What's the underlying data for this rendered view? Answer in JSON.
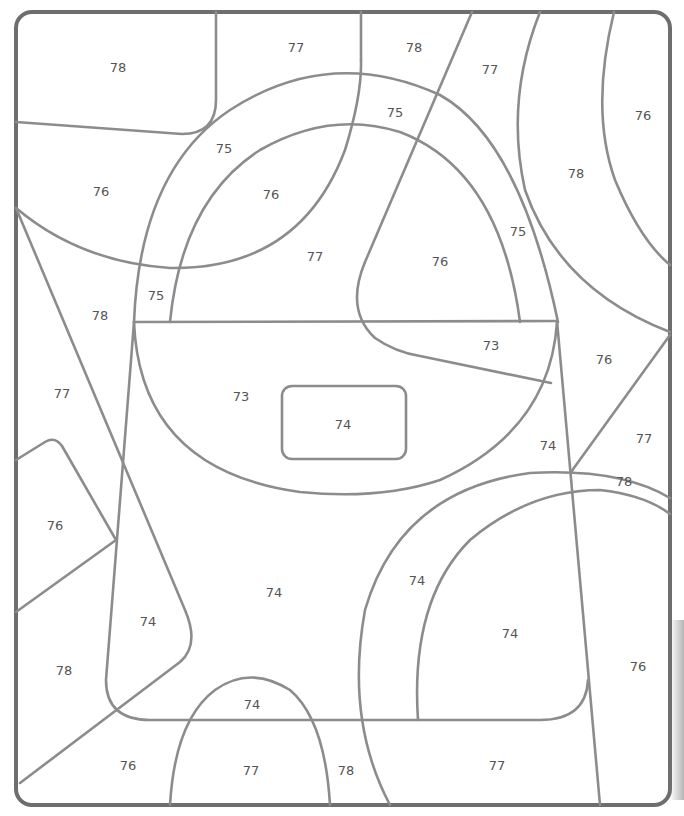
{
  "worksheet": {
    "frame_color": "#6e6e6e",
    "line_color": "#8c8c8c",
    "regions": [
      {
        "label": "78",
        "x": 118,
        "y": 67
      },
      {
        "label": "77",
        "x": 296,
        "y": 47
      },
      {
        "label": "78",
        "x": 414,
        "y": 47
      },
      {
        "label": "77",
        "x": 490,
        "y": 69
      },
      {
        "label": "76",
        "x": 643,
        "y": 115
      },
      {
        "label": "75",
        "x": 395,
        "y": 112
      },
      {
        "label": "75",
        "x": 224,
        "y": 148
      },
      {
        "label": "76",
        "x": 101,
        "y": 191
      },
      {
        "label": "76",
        "x": 271,
        "y": 194
      },
      {
        "label": "78",
        "x": 576,
        "y": 173
      },
      {
        "label": "77",
        "x": 315,
        "y": 256
      },
      {
        "label": "76",
        "x": 440,
        "y": 261
      },
      {
        "label": "75",
        "x": 518,
        "y": 231
      },
      {
        "label": "75",
        "x": 156,
        "y": 295
      },
      {
        "label": "78",
        "x": 100,
        "y": 315
      },
      {
        "label": "73",
        "x": 491,
        "y": 345
      },
      {
        "label": "76",
        "x": 604,
        "y": 359
      },
      {
        "label": "77",
        "x": 62,
        "y": 393
      },
      {
        "label": "73",
        "x": 241,
        "y": 396
      },
      {
        "label": "74",
        "x": 343,
        "y": 424
      },
      {
        "label": "74",
        "x": 548,
        "y": 445
      },
      {
        "label": "77",
        "x": 644,
        "y": 438
      },
      {
        "label": "78",
        "x": 624,
        "y": 481
      },
      {
        "label": "76",
        "x": 55,
        "y": 525
      },
      {
        "label": "74",
        "x": 274,
        "y": 592
      },
      {
        "label": "74",
        "x": 417,
        "y": 580
      },
      {
        "label": "74",
        "x": 148,
        "y": 621
      },
      {
        "label": "74",
        "x": 510,
        "y": 633
      },
      {
        "label": "78",
        "x": 64,
        "y": 670
      },
      {
        "label": "76",
        "x": 638,
        "y": 666
      },
      {
        "label": "74",
        "x": 252,
        "y": 704
      },
      {
        "label": "76",
        "x": 128,
        "y": 765
      },
      {
        "label": "77",
        "x": 251,
        "y": 770
      },
      {
        "label": "78",
        "x": 346,
        "y": 770
      },
      {
        "label": "77",
        "x": 497,
        "y": 765
      }
    ]
  }
}
